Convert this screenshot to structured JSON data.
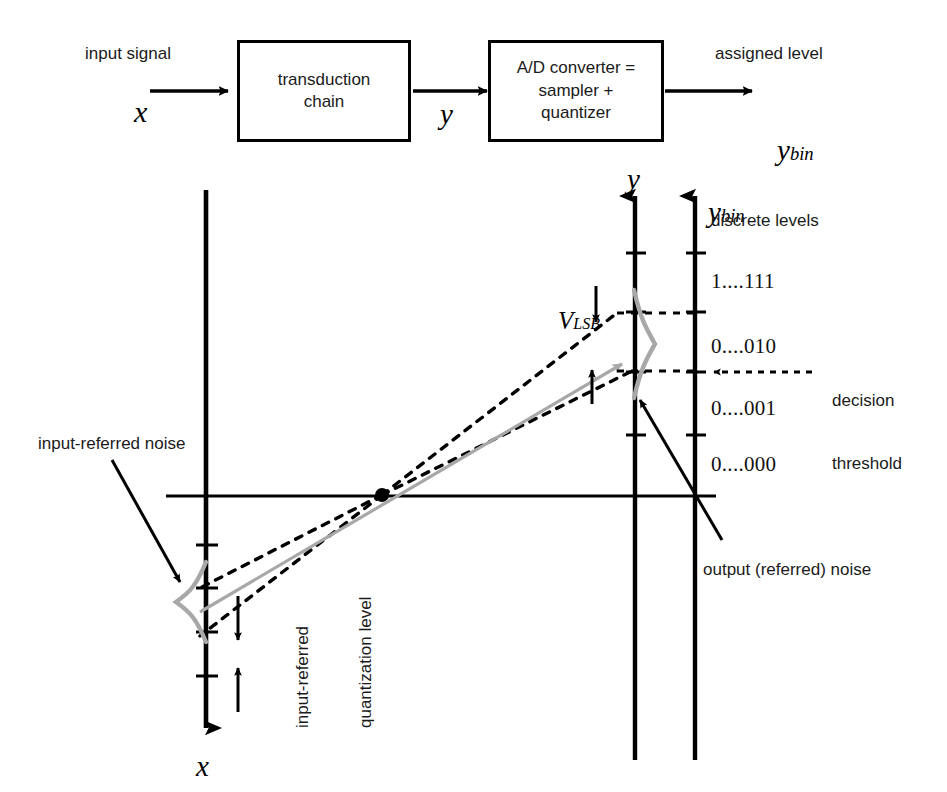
{
  "figure": {
    "top_diagram": {
      "input_label": "input signal",
      "input_symbol": "x",
      "block1": "transduction\nchain",
      "mid_symbol": "y",
      "block2": "A/D converter =\nsampler +\nquantizer",
      "output_label": "assigned level",
      "output_symbol_base": "y",
      "output_symbol_sub": "bin"
    },
    "axes": {
      "x_axis_label": "x",
      "y_axis_label": "y",
      "ybin_axis_label_base": "y",
      "ybin_axis_label_sub": "bin"
    },
    "annotations": {
      "discrete_levels": "discrete levels",
      "vlsb_base": "V",
      "vlsb_sub": "LSB",
      "input_referred_noise": "input-referred noise",
      "input_referred_quantization_level_line1": "input-referred",
      "input_referred_quantization_level_line2": "quantization level",
      "output_referred_noise": "output (referred) noise",
      "decision_threshold_line1": "decision",
      "decision_threshold_line2": "threshold"
    },
    "discrete_level_codes": [
      "1....111",
      "0....010",
      "0....001",
      "0....000"
    ],
    "colors": {
      "stroke": "#000000",
      "noise_curve": "#a8a8a8",
      "gray_arrow": "#a8a8a8",
      "background": "#ffffff"
    }
  }
}
